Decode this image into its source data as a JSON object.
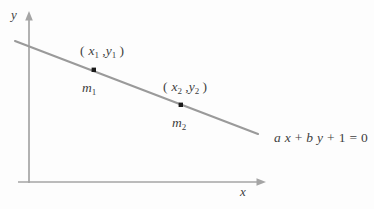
{
  "figure": {
    "type": "line-diagram",
    "background_color": "#fdfdfd",
    "line_color": "#9a9a9a",
    "axis_color": "#a5a5a5",
    "text_color": "#3f3f3f",
    "point_color": "#1a1a1a"
  },
  "axes": {
    "x_label": "x",
    "y_label": "y",
    "origin": {
      "x": 29,
      "y": 182
    }
  },
  "line": {
    "equation": {
      "a_coeff": "a",
      "x_var": "x",
      "plus_1": "+",
      "b_coeff": "b",
      "y_var": "y",
      "plus_2": "+",
      "constant": "1",
      "equals": "=",
      "rhs": "0",
      "full_text": "a x + b y + 1 = 0"
    },
    "start": {
      "x": 15,
      "y": 41
    },
    "end": {
      "x": 258,
      "y": 134
    }
  },
  "points": [
    {
      "id": "point-1",
      "coord_label": {
        "open": "(",
        "x_var": "x",
        "x_sub": "1",
        "comma": ",",
        "y_var": "y",
        "y_sub": "1",
        "close": ")"
      },
      "slope_label": {
        "m_var": "m",
        "m_sub": "1"
      },
      "position": {
        "x": 94,
        "y": 70
      }
    },
    {
      "id": "point-2",
      "coord_label": {
        "open": "(",
        "x_var": "x",
        "x_sub": "2",
        "comma": ",",
        "y_var": "y",
        "y_sub": "2",
        "close": ")"
      },
      "slope_label": {
        "m_var": "m",
        "m_sub": "2"
      },
      "position": {
        "x": 181,
        "y": 105
      }
    }
  ]
}
